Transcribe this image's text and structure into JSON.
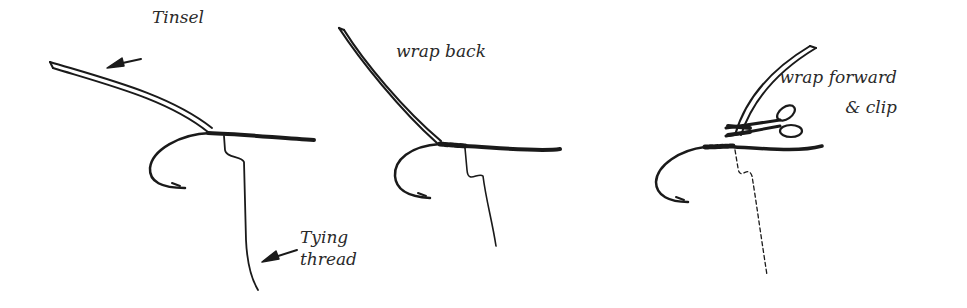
{
  "diagram": {
    "panels": [
      {
        "id": "panel-1",
        "labels": {
          "tinsel": "Tinsel",
          "thread_line1": "Tying",
          "thread_line2": "thread"
        }
      },
      {
        "id": "panel-2",
        "labels": {
          "step": "wrap back"
        }
      },
      {
        "id": "panel-3",
        "labels": {
          "step_line1": "wrap forward",
          "step_line2": "& clip"
        }
      }
    ],
    "colors": {
      "ink": "#1a1a1a",
      "background": "#ffffff"
    }
  }
}
